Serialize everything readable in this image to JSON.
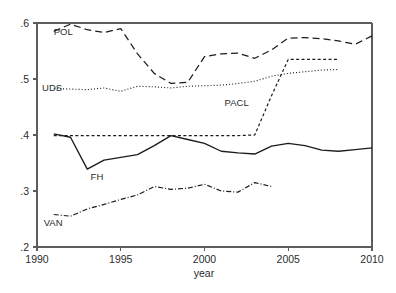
{
  "chart_data": {
    "type": "line",
    "title": "",
    "xlabel": "year",
    "ylabel": "",
    "xlim": [
      1990,
      2010
    ],
    "ylim": [
      0.2,
      0.6
    ],
    "grid": false,
    "legend_position": "inline-annotations",
    "xticks": [
      "1990",
      "1995",
      "2000",
      "2005",
      "2010"
    ],
    "xtick_values": [
      1990,
      1995,
      2000,
      2005,
      2010
    ],
    "yticks": [
      ".2",
      ".3",
      ".4",
      ".5",
      ".6"
    ],
    "ytick_values": [
      0.2,
      0.3,
      0.4,
      0.5,
      0.6
    ],
    "series": [
      {
        "name": "POL",
        "label": "POL",
        "style": "long-dash",
        "x": [
          1991,
          1992,
          1993,
          1994,
          1995,
          1996,
          1997,
          1998,
          1999,
          2000,
          2001,
          2002,
          2003,
          2004,
          2005,
          2006,
          2007,
          2008,
          2009,
          2010
        ],
        "values": [
          0.585,
          0.598,
          0.588,
          0.583,
          0.59,
          0.545,
          0.51,
          0.492,
          0.494,
          0.54,
          0.545,
          0.546,
          0.537,
          0.552,
          0.573,
          0.574,
          0.572,
          0.568,
          0.562,
          0.577
        ]
      },
      {
        "name": "UDS",
        "label": "UDS",
        "style": "dotted",
        "x": [
          1991,
          1992,
          1993,
          1994,
          1995,
          1996,
          1997,
          1998,
          1999,
          2000,
          2001,
          2002,
          2003,
          2004,
          2005,
          2006,
          2007,
          2008
        ],
        "values": [
          0.483,
          0.482,
          0.481,
          0.484,
          0.478,
          0.487,
          0.486,
          0.484,
          0.487,
          0.488,
          0.489,
          0.492,
          0.496,
          0.505,
          0.51,
          0.513,
          0.516,
          0.517
        ]
      },
      {
        "name": "PACL",
        "label": "PACL",
        "style": "short-dash",
        "x": [
          1991,
          1992,
          1993,
          1994,
          1995,
          1996,
          1997,
          1998,
          1999,
          2000,
          2001,
          2002,
          2003,
          2004,
          2005,
          2006,
          2007,
          2008
        ],
        "values": [
          0.399,
          0.399,
          0.399,
          0.399,
          0.399,
          0.399,
          0.399,
          0.399,
          0.399,
          0.399,
          0.399,
          0.399,
          0.4,
          0.47,
          0.535,
          0.535,
          0.535,
          0.535
        ]
      },
      {
        "name": "FH",
        "label": "FH",
        "style": "solid",
        "x": [
          1991,
          1992,
          1993,
          1994,
          1995,
          1996,
          1997,
          1998,
          1999,
          2000,
          2001,
          2002,
          2003,
          2004,
          2005,
          2006,
          2007,
          2008,
          2009,
          2010
        ],
        "values": [
          0.402,
          0.396,
          0.339,
          0.355,
          0.36,
          0.365,
          0.381,
          0.399,
          0.392,
          0.385,
          0.371,
          0.368,
          0.366,
          0.38,
          0.385,
          0.381,
          0.373,
          0.371,
          0.374,
          0.377
        ]
      },
      {
        "name": "VAN",
        "label": "VAN",
        "style": "dash-dot",
        "x": [
          1991,
          1992,
          1993,
          1994,
          1995,
          1996,
          1997,
          1998,
          1999,
          2000,
          2001,
          2002,
          2003,
          2004
        ],
        "values": [
          0.258,
          0.255,
          0.268,
          0.276,
          0.285,
          0.293,
          0.308,
          0.303,
          0.305,
          0.312,
          0.3,
          0.298,
          0.315,
          0.308
        ]
      }
    ],
    "annotations": [
      {
        "text": "POL",
        "x": 1991.0,
        "y": 0.578
      },
      {
        "text": "UDS",
        "x": 1990.3,
        "y": 0.479
      },
      {
        "text": "PACL",
        "x": 2001.2,
        "y": 0.452
      },
      {
        "text": "FH",
        "x": 1993.2,
        "y": 0.32
      },
      {
        "text": "VAN",
        "x": 1990.4,
        "y": 0.238
      }
    ],
    "colors": {
      "line": "#1c1c1c",
      "axis": "#5c5c5c",
      "text": "#2b2b2b",
      "background": "#ffffff"
    }
  }
}
